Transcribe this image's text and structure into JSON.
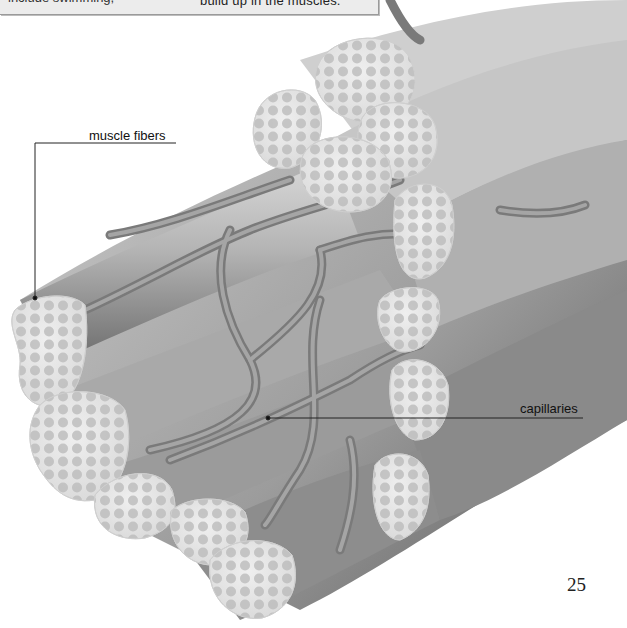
{
  "caption": {
    "left_fragment": "include swimming,",
    "right_fragment": "build up in the muscles."
  },
  "illustration": {
    "subject": "muscle fiber bundle with capillaries",
    "labels": [
      {
        "id": "muscle-fibers",
        "text": "muscle fibers"
      },
      {
        "id": "capillaries",
        "text": "capillaries"
      }
    ]
  },
  "page": {
    "number": "25"
  },
  "colors": {
    "background": "#ffffff",
    "caption_box": "#ececec",
    "fiber_face": "#e6e6e6",
    "fibril": "#bdbdbd",
    "fiber_body": "#a8a8a8",
    "capillary": "#8f8f8f"
  }
}
